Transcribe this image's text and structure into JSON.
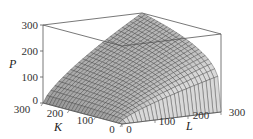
{
  "chart_data": {
    "type": "surface3d",
    "title": "",
    "function": "P = L^0.75 * K^0.25",
    "x": {
      "name": "L",
      "label": "L",
      "range": [
        0,
        300
      ],
      "ticks": [
        0,
        100,
        200,
        300
      ]
    },
    "y": {
      "name": "K",
      "label": "K",
      "range": [
        0,
        300
      ],
      "ticks": [
        0,
        100,
        200,
        300
      ]
    },
    "z": {
      "name": "P",
      "label": "P",
      "range": [
        0,
        300
      ],
      "ticks": [
        0,
        100,
        200,
        300
      ]
    },
    "grid_lines": 25,
    "box": true,
    "colors": {
      "surface_light": "#d9d9d9",
      "surface_dark": "#8a8a8a",
      "mesh": "#2b2b2b",
      "box": "#555555"
    },
    "sample_values": [
      {
        "L": 0,
        "K": 0,
        "P": 0
      },
      {
        "L": 300,
        "K": 0,
        "P": 0
      },
      {
        "L": 0,
        "K": 300,
        "P": 0
      },
      {
        "L": 300,
        "K": 300,
        "P": 300
      },
      {
        "L": 150,
        "K": 150,
        "P": 150
      },
      {
        "L": 300,
        "K": 100,
        "P": 228
      },
      {
        "L": 100,
        "K": 300,
        "P": 132
      }
    ]
  },
  "axes": {
    "p_label": "P",
    "k_label": "K",
    "l_label": "L",
    "p_ticks": [
      "0",
      "100",
      "200",
      "300"
    ],
    "k_ticks": [
      "300",
      "200",
      "100",
      "0"
    ],
    "l_ticks": [
      "0",
      "100",
      "200",
      "300"
    ]
  }
}
